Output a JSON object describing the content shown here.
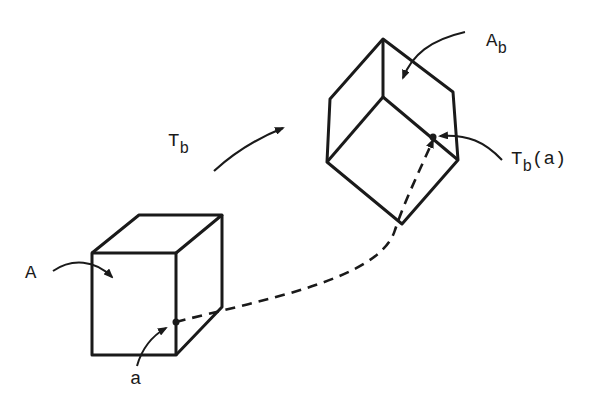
{
  "diagram": {
    "labels": {
      "A": {
        "text": "A"
      },
      "a": {
        "text": "a"
      },
      "T_b": {
        "base": "T",
        "sub": "b"
      },
      "A_b": {
        "base": "A",
        "sub": "b"
      },
      "T_b_a": {
        "base": "T",
        "sub": "b",
        "suffix": "(a)"
      }
    },
    "colors": {
      "ink": "#1a1a1a",
      "background": "#ffffff"
    }
  }
}
